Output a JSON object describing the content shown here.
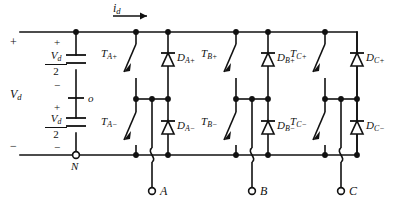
{
  "figure": {
    "type": "schematic",
    "width": 399,
    "height": 208,
    "line_color": "#111111",
    "background": "#ffffff"
  },
  "source": {
    "dc_label": "V",
    "dc_label_sub": "d",
    "top_plus": "+",
    "bottom_minus": "−",
    "cap_top": {
      "plus": "+",
      "minus": "−",
      "value_num": "V",
      "value_num_sub": "d",
      "value_den": "2"
    },
    "cap_bottom": {
      "plus": "+",
      "minus": "−",
      "value_num": "V",
      "value_num_sub": "d",
      "value_den": "2"
    },
    "midpoint_node": "o",
    "negative_node": "N"
  },
  "current": {
    "label": "i",
    "label_sub": "d",
    "arrow": "right-arrow-icon"
  },
  "legs": [
    {
      "phase": "A",
      "upper_switch": {
        "name": "T",
        "sub": "A+"
      },
      "upper_diode": {
        "name": "D",
        "sub": "A+"
      },
      "lower_switch": {
        "name": "T",
        "sub": "A−"
      },
      "lower_diode": {
        "name": "D",
        "sub": "A−"
      },
      "output_terminal": "A"
    },
    {
      "phase": "B",
      "upper_switch": {
        "name": "T",
        "sub": "B+"
      },
      "upper_diode": {
        "name": "D",
        "sub": "B+"
      },
      "lower_switch": {
        "name": "T",
        "sub": "B−"
      },
      "lower_diode": {
        "name": "D",
        "sub": "B−"
      },
      "output_terminal": "B"
    },
    {
      "phase": "C",
      "upper_switch": {
        "name": "T",
        "sub": "C+"
      },
      "upper_diode": {
        "name": "D",
        "sub": "C+"
      },
      "lower_switch": {
        "name": "T",
        "sub": "C−"
      },
      "lower_diode": {
        "name": "D",
        "sub": "C−"
      },
      "output_terminal": "C"
    }
  ]
}
